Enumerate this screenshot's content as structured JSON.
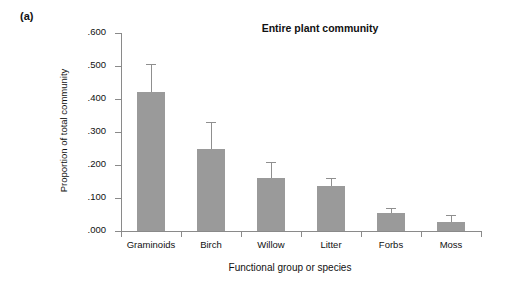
{
  "panel": {
    "label": "(a)"
  },
  "chart_data": {
    "type": "bar",
    "title": "Entire plant community",
    "xlabel": "Functional group or species",
    "ylabel": "Proportion of total community",
    "categories": [
      "Graminoids",
      "Birch",
      "Willow",
      "Litter",
      "Forbs",
      "Moss"
    ],
    "values": [
      0.422,
      0.248,
      0.16,
      0.137,
      0.056,
      0.028
    ],
    "errors_upper": [
      0.506,
      0.33,
      0.209,
      0.161,
      0.07,
      0.048
    ],
    "error_bars": [
      0.084,
      0.082,
      0.049,
      0.024,
      0.014,
      0.02
    ],
    "ylim": [
      0.0,
      0.6
    ],
    "ytick_labels": [
      ".600",
      ".500",
      ".400",
      ".300",
      ".200",
      ".100",
      ".000"
    ],
    "ytick_values": [
      0.6,
      0.5,
      0.4,
      0.3,
      0.2,
      0.1,
      0.0
    ],
    "grid": false,
    "legend": false,
    "bar_color": "#9a9a9a",
    "axis_color": "#8a8a8a",
    "text_color": "#111111"
  }
}
